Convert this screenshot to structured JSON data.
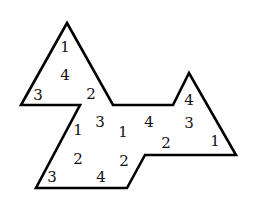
{
  "figure": {
    "stroke_color": "#000000",
    "outline_points": [
      [
        67,
        23
      ],
      [
        113,
        105
      ],
      [
        173,
        105
      ],
      [
        189,
        73
      ],
      [
        236,
        155
      ],
      [
        145,
        155
      ],
      [
        127,
        188
      ],
      [
        36,
        188
      ],
      [
        80,
        105
      ],
      [
        21,
        105
      ]
    ],
    "labels": [
      {
        "text": "1",
        "x": 65,
        "y": 52
      },
      {
        "text": "4",
        "x": 65,
        "y": 80
      },
      {
        "text": "3",
        "x": 38,
        "y": 100
      },
      {
        "text": "2",
        "x": 91,
        "y": 99
      },
      {
        "text": "1",
        "x": 78,
        "y": 135
      },
      {
        "text": "3",
        "x": 100,
        "y": 127
      },
      {
        "text": "1",
        "x": 123,
        "y": 137
      },
      {
        "text": "4",
        "x": 149,
        "y": 127
      },
      {
        "text": "4",
        "x": 189,
        "y": 105
      },
      {
        "text": "3",
        "x": 189,
        "y": 128
      },
      {
        "text": "2",
        "x": 166,
        "y": 148
      },
      {
        "text": "1",
        "x": 215,
        "y": 146
      },
      {
        "text": "2",
        "x": 78,
        "y": 164
      },
      {
        "text": "2",
        "x": 124,
        "y": 166
      },
      {
        "text": "3",
        "x": 52,
        "y": 182
      },
      {
        "text": "4",
        "x": 101,
        "y": 182
      }
    ]
  }
}
